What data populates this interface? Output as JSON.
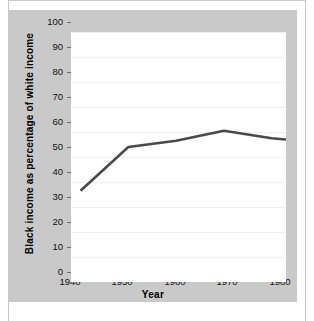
{
  "figure": {
    "panel_color": "#c9c9c9",
    "plot_background": "#ffffff",
    "gridline_color": "#f0f0f0",
    "line_color": "#4a4a4a"
  },
  "chart_data": {
    "type": "line",
    "title": "",
    "xlabel": "Year",
    "ylabel": "Black income as  percentage of white income",
    "x": [
      1940,
      1950,
      1960,
      1970,
      1980,
      1983
    ],
    "values": [
      36.5,
      54.0,
      56.5,
      60.5,
      57.5,
      57.0
    ],
    "series": [
      {
        "name": "Black income as percentage of white income",
        "values": [
          36.5,
          54.0,
          56.5,
          60.5,
          57.5,
          57.0
        ]
      }
    ],
    "xlim": [
      1938,
      1983
    ],
    "ylim": [
      0,
      100
    ],
    "xticks": [
      1940,
      1950,
      1960,
      1970,
      1980
    ],
    "xticklabels": [
      "1940",
      "1950",
      "1960",
      "1970",
      "1980"
    ],
    "yticks": [
      0,
      10,
      20,
      30,
      40,
      50,
      60,
      70,
      80,
      90,
      100
    ],
    "yticklabels": [
      "0",
      "10",
      "20",
      "30",
      "40",
      "50",
      "60",
      "70",
      "80",
      "90",
      "100"
    ],
    "grid": true,
    "grid_axis": "y",
    "legend": false,
    "legend_position": "none"
  }
}
